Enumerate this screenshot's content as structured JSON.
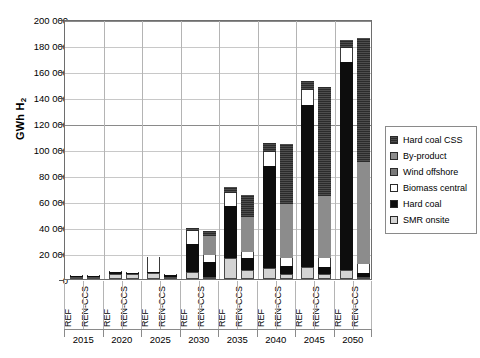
{
  "chart_data": {
    "type": "bar",
    "stacked": true,
    "title": "",
    "xlabel": "",
    "ylabel": "GWh H2",
    "ylabel_display": "GWh H",
    "ylabel_sub": "2",
    "ylim": [
      0,
      200000
    ],
    "ytick_step": 20000,
    "ytick_labels": [
      "0",
      "20 000",
      "40 000",
      "60 000",
      "80 000",
      "100 000",
      "120 000",
      "140 000",
      "160 000",
      "180 000",
      "200 000"
    ],
    "ytick_values": [
      0,
      20000,
      40000,
      60000,
      80000,
      100000,
      120000,
      140000,
      160000,
      180000,
      200000
    ],
    "grid": true,
    "legend_position": "right",
    "years": [
      "2015",
      "2020",
      "2025",
      "2030",
      "2035",
      "2040",
      "2045",
      "2050"
    ],
    "scenarios": [
      "REF",
      "REN-CCS"
    ],
    "series": [
      {
        "name": "SMR onsite",
        "key": "smr",
        "color": "#d4d4d4",
        "values": [
          900,
          700,
          4200,
          3800,
          4500,
          1500,
          5200,
          1800,
          16500,
          7000,
          8800,
          3500,
          9500,
          4200,
          7200,
          1200
        ]
      },
      {
        "name": "Hard coal",
        "key": "hardcoal",
        "color": "#0d0d0d",
        "values": [
          200,
          150,
          900,
          700,
          1200,
          1400,
          22000,
          11500,
          40000,
          9500,
          78000,
          6500,
          124000,
          5200,
          160000,
          3000
        ]
      },
      {
        "name": "Biomass central",
        "key": "biomass",
        "color": "#ffffff",
        "values": [
          100,
          100,
          300,
          300,
          11500,
          700,
          9500,
          5000,
          9500,
          4500,
          11000,
          6000,
          12000,
          6500,
          10500,
          6800
        ]
      },
      {
        "name": "Wind offshore",
        "key": "wind",
        "color": "#7a7a7a",
        "values": [
          0,
          0,
          0,
          0,
          0,
          0,
          0,
          0,
          0,
          0,
          0,
          0,
          0,
          0,
          0,
          0
        ]
      },
      {
        "name": "By-product",
        "key": "byproduct",
        "color": "#8c8c8c",
        "values": [
          0,
          0,
          0,
          0,
          0,
          0,
          0,
          15000,
          0,
          26500,
          0,
          42000,
          0,
          48000,
          0,
          79000
        ]
      },
      {
        "name": "Hard coal CSS",
        "key": "hccss",
        "color": "#3a3a3a",
        "values": [
          0,
          0,
          0,
          0,
          0,
          0,
          2500,
          3500,
          4500,
          17500,
          6500,
          45500,
          6500,
          84000,
          6500,
          95000
        ]
      }
    ],
    "bar_totals": [
      1200,
      950,
      5400,
      4800,
      17200,
      3600,
      39200,
      36800,
      70500,
      65000,
      104300,
      103500,
      152000,
      147900,
      184200,
      185000
    ],
    "legend_entries": [
      "Hard coal CSS",
      "By-product",
      "Wind offshore",
      "Biomass central",
      "Hard coal",
      "SMR onsite"
    ]
  }
}
